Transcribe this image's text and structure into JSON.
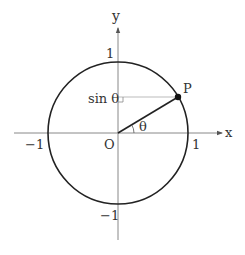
{
  "diagram": {
    "type": "unit-circle",
    "colors": {
      "background": "#ffffff",
      "circle": "#222222",
      "axes": "#777777",
      "guide": "#999999",
      "text": "#333333"
    },
    "labels": {
      "x_axis": "x",
      "y_axis": "y",
      "origin": "O",
      "point": "P",
      "angle": "θ",
      "sin_label": "sin θ",
      "x_pos_one": "1",
      "x_neg_one": "−1",
      "y_pos_one": "1",
      "y_neg_one": "−1"
    },
    "geometry": {
      "radius": 1,
      "point_P_angle_deg": 30
    }
  }
}
